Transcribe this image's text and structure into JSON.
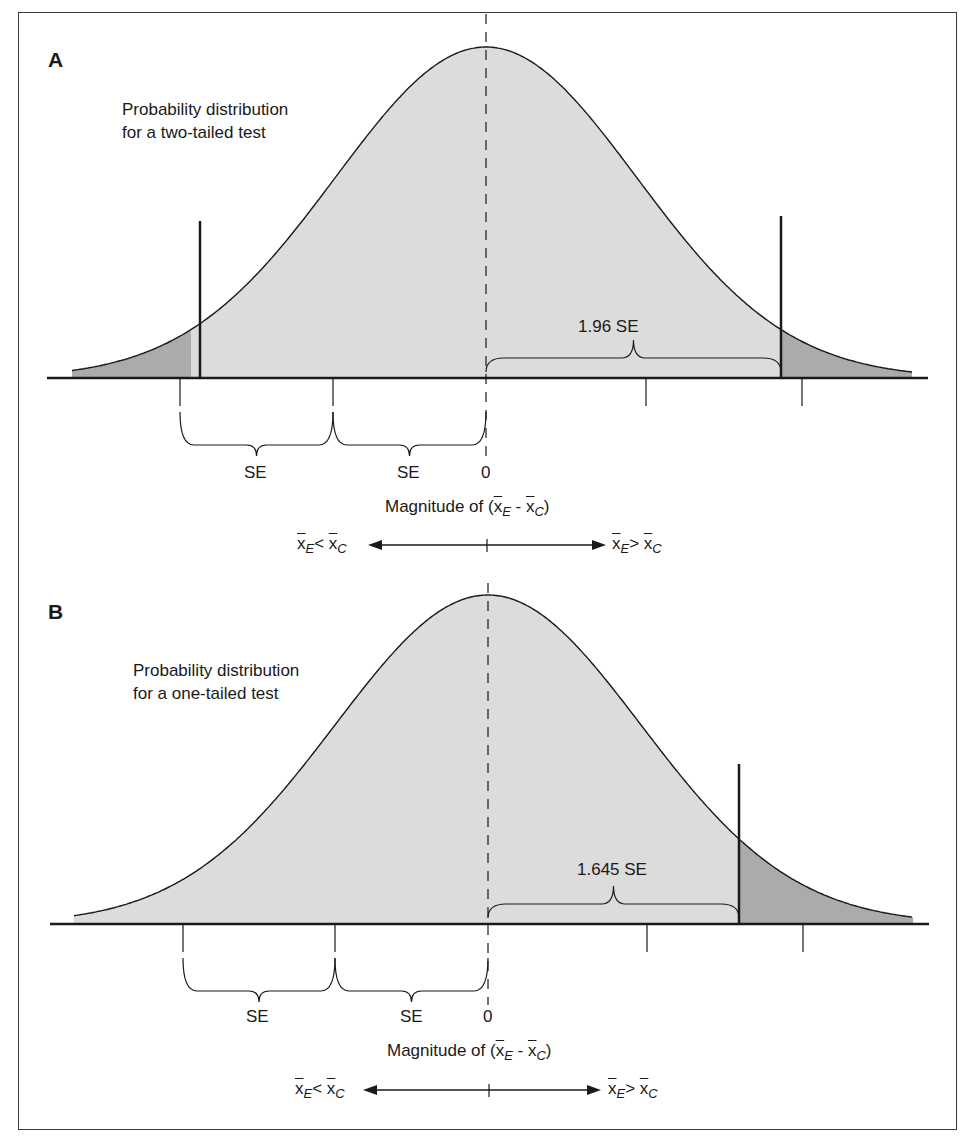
{
  "figure": {
    "colors": {
      "body_fill": "#dcdcdc",
      "tail_fill": "#ababab",
      "stroke": "#1a1a1a",
      "frame": "#3a3a3a"
    },
    "panels": [
      {
        "id": "A",
        "letter": "A",
        "description_line1": "Probability distribution",
        "description_line2": "for a two-tailed test",
        "test_type": "two-tailed",
        "critical_label": "1.96 SE",
        "critical_z": 1.96,
        "se_labels": [
          "SE",
          "SE"
        ],
        "zero_label": "0",
        "axis_label_prefix": "Magnitude of (",
        "axis_label_suffix": ")",
        "direction_left": "x̄E < x̄C",
        "direction_right": "x̄E > x̄C",
        "geometry": {
          "mean_x": 486,
          "baseline_y": 378,
          "peak_y": 47,
          "se_px": 150.5,
          "x_start": 72,
          "x_end": 912,
          "axis_x0": 47,
          "axis_x1": 928,
          "ticks_x": [
            180,
            333,
            646,
            802
          ],
          "crit_lines": [
            {
              "x": 200,
              "top": 221
            },
            {
              "x": 781,
              "top": 216
            }
          ],
          "dash_top": 14,
          "dash_bottom": 460
        }
      },
      {
        "id": "B",
        "letter": "B",
        "description_line1": "Probability distribution",
        "description_line2": "for a one-tailed test",
        "test_type": "one-tailed",
        "critical_label": "1.645 SE",
        "critical_z": 1.645,
        "se_labels": [
          "SE",
          "SE"
        ],
        "zero_label": "0",
        "axis_label_prefix": "Magnitude of (",
        "axis_label_suffix": ")",
        "direction_left": "x̄E < x̄C",
        "direction_right": "x̄E > x̄C",
        "geometry": {
          "mean_x": 488,
          "baseline_y": 924,
          "peak_y": 595,
          "se_px": 152.6,
          "x_start": 74,
          "x_end": 913,
          "axis_x0": 50,
          "axis_x1": 929,
          "ticks_x": [
            183,
            335,
            647,
            803
          ],
          "crit_lines": [
            {
              "x": 739,
              "top": 764
            }
          ],
          "dash_top": 583,
          "dash_bottom": 1005
        }
      }
    ]
  },
  "chart_data": [
    {
      "type": "area",
      "title": "A — Probability distribution for a two-tailed test",
      "xlabel": "Magnitude of (x̄E − x̄C)",
      "ylabel": "",
      "distribution": "normal",
      "mean": 0,
      "x_unit": "SE",
      "shaded_regions": [
        {
          "from": "-inf",
          "to": -1.96,
          "label": "lower rejection tail"
        },
        {
          "from": 1.96,
          "to": "inf",
          "label": "upper rejection tail"
        }
      ],
      "critical_values": [
        -1.96,
        1.96
      ],
      "annotations": [
        "1.96 SE",
        "SE",
        "SE",
        "0"
      ],
      "direction_labels": [
        "x̄E < x̄C",
        "x̄E > x̄C"
      ],
      "ticks": [
        -2,
        -1,
        0,
        1,
        2
      ]
    },
    {
      "type": "area",
      "title": "B — Probability distribution for a one-tailed test",
      "xlabel": "Magnitude of (x̄E − x̄C)",
      "ylabel": "",
      "distribution": "normal",
      "mean": 0,
      "x_unit": "SE",
      "shaded_regions": [
        {
          "from": 1.645,
          "to": "inf",
          "label": "upper rejection tail"
        }
      ],
      "critical_values": [
        1.645
      ],
      "annotations": [
        "1.645 SE",
        "SE",
        "SE",
        "0"
      ],
      "direction_labels": [
        "x̄E < x̄C",
        "x̄E > x̄C"
      ],
      "ticks": [
        -2,
        -1,
        0,
        1,
        2
      ]
    }
  ]
}
